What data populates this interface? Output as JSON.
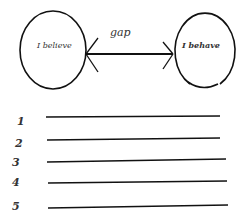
{
  "diagram": {
    "left_circle": {
      "label": "I believe"
    },
    "right_circle": {
      "label": "I behave"
    },
    "arrow": {
      "label": "gap",
      "direction": "bidirectional"
    }
  },
  "lines": [
    {
      "number": "1"
    },
    {
      "number": "2"
    },
    {
      "number": "3"
    },
    {
      "number": "4"
    },
    {
      "number": "5"
    }
  ],
  "colors": {
    "ink": "#111111",
    "background": "#ffffff"
  }
}
